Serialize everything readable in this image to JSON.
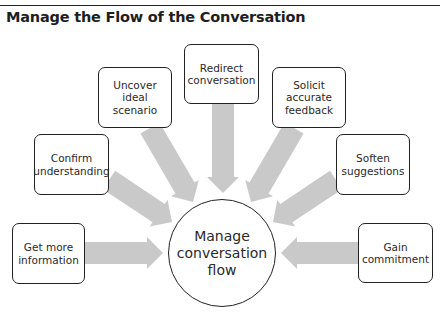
{
  "header": {
    "title": "Manage the Flow of the Conversation"
  },
  "diagram": {
    "arrow_color": "#c9c9c9",
    "line_color": "#222222",
    "hub": {
      "label": "Manage\nconversation\nflow",
      "cx": 222,
      "cy": 253,
      "r": 54
    },
    "nodes": [
      {
        "id": "get-more-information",
        "label": "Get more\ninformation",
        "x": 12,
        "y": 223,
        "w": 73,
        "h": 61
      },
      {
        "id": "confirm-understanding",
        "label": "Confirm\nunderstanding",
        "x": 34,
        "y": 134,
        "w": 75,
        "h": 61
      },
      {
        "id": "uncover-ideal-scenario",
        "label": "Uncover ideal\nscenario",
        "x": 98,
        "y": 67,
        "w": 74,
        "h": 61
      },
      {
        "id": "redirect-conversation",
        "label": "Redirect\nconversation",
        "x": 184,
        "y": 44,
        "w": 75,
        "h": 60
      },
      {
        "id": "solicit-accurate-feedback",
        "label": "Solicit accurate\nfeedback",
        "x": 272,
        "y": 67,
        "w": 74,
        "h": 61
      },
      {
        "id": "soften-suggestions",
        "label": "Soften\nsuggestions",
        "x": 336,
        "y": 134,
        "w": 74,
        "h": 61
      },
      {
        "id": "gain-commitment",
        "label": "Gain\ncommitment",
        "x": 358,
        "y": 223,
        "w": 75,
        "h": 60
      }
    ],
    "arrows": [
      {
        "from": "get-more-information",
        "x1": 85,
        "y1": 253,
        "x2": 163,
        "y2": 253
      },
      {
        "from": "confirm-understanding",
        "x1": 109,
        "y1": 180,
        "x2": 172,
        "y2": 222
      },
      {
        "from": "uncover-ideal-scenario",
        "x1": 150,
        "y1": 128,
        "x2": 193,
        "y2": 202
      },
      {
        "from": "redirect-conversation",
        "x1": 223,
        "y1": 104,
        "x2": 223,
        "y2": 193
      },
      {
        "from": "solicit-accurate-feedback",
        "x1": 294,
        "y1": 128,
        "x2": 251,
        "y2": 202
      },
      {
        "from": "soften-suggestions",
        "x1": 336,
        "y1": 180,
        "x2": 273,
        "y2": 222
      },
      {
        "from": "gain-commitment",
        "x1": 358,
        "y1": 253,
        "x2": 281,
        "y2": 253
      }
    ]
  }
}
